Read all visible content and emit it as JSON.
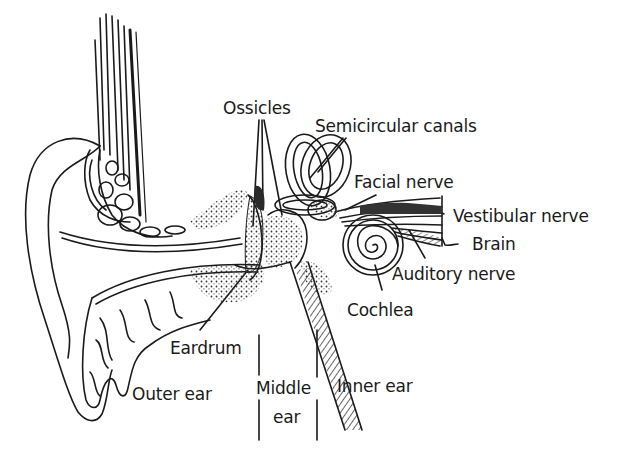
{
  "diagram": {
    "labels": {
      "ossicles": "Ossicles",
      "semicircular_canals": "Semicircular canals",
      "facial_nerve": "Facial nerve",
      "vestibular_nerve": "Vestibular nerve",
      "brain": "Brain",
      "auditory_nerve": "Auditory nerve",
      "cochlea": "Cochlea",
      "eardrum": "Eardrum",
      "outer_ear": "Outer ear",
      "middle_ear_line1": "Middle",
      "middle_ear_line2": "ear",
      "inner_ear": "Inner ear"
    },
    "colors": {
      "ink": "#1a1a1a",
      "background": "#ffffff",
      "stipple": "#333333"
    }
  }
}
